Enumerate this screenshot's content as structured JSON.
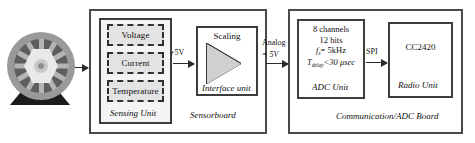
{
  "diagram": {
    "source_icon": "wheel-icon",
    "sensing_unit": {
      "caption": "Sensing Unit",
      "sensors": [
        {
          "label": "Voltage"
        },
        {
          "label": "Current"
        },
        {
          "label": "Temperature"
        }
      ]
    },
    "interface_unit": {
      "caption": "Interface unit",
      "amp_label": "Scaling",
      "amp_icon": "triangle-amplifier-icon"
    },
    "sensorboard": {
      "caption": "Sensorboard"
    },
    "adc_unit": {
      "caption": "ADC Unit",
      "spec_channels": "8 channels",
      "spec_bits": "12 bits",
      "spec_fs_symbol": "f",
      "spec_fs_sub": "s",
      "spec_fs_value": "= 5kHz",
      "spec_tdelay_symbol": "T",
      "spec_tdelay_sub": "delay",
      "spec_tdelay_value": "<30 μsec"
    },
    "radio_unit": {
      "caption": "Radio Unit",
      "chip": "CC2420"
    },
    "comm_board": {
      "caption": "Communication/ADC Board"
    },
    "arrows": [
      {
        "name": "arrow-wheel-to-sensorboard",
        "label": ""
      },
      {
        "name": "arrow-sensing-to-interface",
        "label": "+5V"
      },
      {
        "name": "arrow-sensorboard-to-adc",
        "label_top": "Analog",
        "label_bottom": "= 5V"
      },
      {
        "name": "arrow-adc-to-radio",
        "label": "SPI"
      }
    ],
    "colors": {
      "border": "#3d3d3d",
      "outer_border": "#4a4a4a",
      "sensor_fill": "#e3e3e3",
      "group_fill": "#f4f4f4",
      "amp_fill": "#d0d0d0",
      "text": "#111111",
      "background": "#ffffff"
    }
  }
}
